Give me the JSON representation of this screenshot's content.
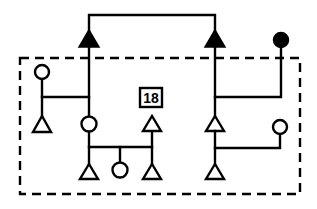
{
  "diagram": {
    "type": "pedigree-style symbol diagram",
    "label": "18",
    "colors": {
      "stroke": "#000000",
      "background": "#ffffff"
    },
    "nodes": [
      {
        "id": "top-left-filled-triangle",
        "shape": "triangle",
        "filled": true
      },
      {
        "id": "top-right-filled-triangle",
        "shape": "triangle",
        "filled": true
      },
      {
        "id": "top-right-filled-circle",
        "shape": "circle",
        "filled": true
      },
      {
        "id": "left-open-circle",
        "shape": "circle",
        "filled": false
      },
      {
        "id": "left-open-triangle",
        "shape": "triangle",
        "filled": false
      },
      {
        "id": "center-open-circle",
        "shape": "circle",
        "filled": false
      },
      {
        "id": "bottom-left-open-triangle",
        "shape": "triangle",
        "filled": false
      },
      {
        "id": "bottom-center-open-circle",
        "shape": "circle",
        "filled": false
      },
      {
        "id": "bottom-right-open-triangle",
        "shape": "triangle",
        "filled": false
      },
      {
        "id": "mid-right-open-triangle",
        "shape": "triangle",
        "filled": false
      },
      {
        "id": "right-open-triangle-upper",
        "shape": "triangle",
        "filled": false
      },
      {
        "id": "right-open-triangle-lower",
        "shape": "triangle",
        "filled": false
      },
      {
        "id": "right-open-circle",
        "shape": "circle",
        "filled": false
      }
    ],
    "grouping": "dashed-boundary"
  }
}
